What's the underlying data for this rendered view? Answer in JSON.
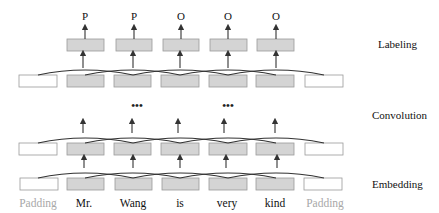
{
  "diagram": {
    "type": "cnn-sequence-labeling",
    "layers": {
      "labeling": "Labeling",
      "convolution": "Convolution",
      "embedding": "Embedding"
    },
    "output_labels": [
      "P",
      "P",
      "O",
      "O",
      "O"
    ],
    "words": [
      "Padding",
      "Mr.",
      "Wang",
      "is",
      "very",
      "kind",
      "Padding"
    ],
    "ellipsis": "•••",
    "colors": {
      "token_box": "#d4d4d4",
      "padding_box": "#ffffff",
      "padding_text": "#a8a8a8",
      "lines": "#333333"
    }
  }
}
